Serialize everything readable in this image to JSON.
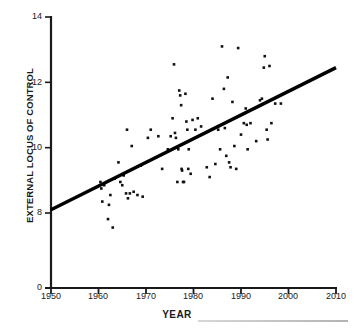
{
  "chart_data": {
    "type": "scatter",
    "title": "",
    "xlabel": "YEAR",
    "ylabel": "EXTERNAL LOCUS OF CONTROL",
    "xlim": [
      1950,
      2010
    ],
    "ylim": [
      0,
      14
    ],
    "y_axis_break": true,
    "y_break_note": "axis jumps from 0 to 8",
    "grid": false,
    "legend": null,
    "xticks": [
      1950,
      1960,
      1970,
      1980,
      1990,
      2000,
      2010
    ],
    "xtick_labels": [
      "1950",
      "1960",
      "1970",
      "1980",
      "1990",
      "2000",
      "2010"
    ],
    "yticks": [
      0,
      8,
      10,
      12,
      14
    ],
    "ytick_labels": [
      "0",
      "8",
      "10",
      "12",
      "14"
    ],
    "marker": "square",
    "marker_color": "#111111",
    "marker_size": 2.6,
    "trendline": {
      "color": "#000000",
      "width": 3.4,
      "x_start": 1950,
      "y_start": 8.1,
      "x_end": 2010,
      "y_end": 12.45
    },
    "points": [
      [
        1960.4,
        8.95
      ],
      [
        1960.6,
        8.75
      ],
      [
        1960.8,
        8.35
      ],
      [
        1961.2,
        8.85
      ],
      [
        1962.0,
        7.35
      ],
      [
        1962.2,
        8.25
      ],
      [
        1962.5,
        8.55
      ],
      [
        1963.0,
        6.45
      ],
      [
        1963.4,
        9.05
      ],
      [
        1964.2,
        9.55
      ],
      [
        1964.6,
        8.95
      ],
      [
        1965.0,
        8.85
      ],
      [
        1965.3,
        9.15
      ],
      [
        1965.8,
        8.6
      ],
      [
        1966.0,
        10.55
      ],
      [
        1966.2,
        8.45
      ],
      [
        1966.6,
        8.6
      ],
      [
        1967.0,
        10.05
      ],
      [
        1967.4,
        8.65
      ],
      [
        1968.2,
        8.55
      ],
      [
        1968.9,
        9.45
      ],
      [
        1969.3,
        8.5
      ],
      [
        1970.4,
        10.3
      ],
      [
        1971.0,
        10.55
      ],
      [
        1972.6,
        10.35
      ],
      [
        1973.4,
        9.35
      ],
      [
        1974.6,
        9.95
      ],
      [
        1975.2,
        10.35
      ],
      [
        1975.6,
        10.9
      ],
      [
        1975.9,
        12.55
      ],
      [
        1976.1,
        10.45
      ],
      [
        1976.3,
        10.3
      ],
      [
        1976.6,
        8.95
      ],
      [
        1976.8,
        9.95
      ],
      [
        1977.0,
        11.75
      ],
      [
        1977.2,
        11.6
      ],
      [
        1977.4,
        11.3
      ],
      [
        1977.5,
        9.35
      ],
      [
        1977.6,
        9.3
      ],
      [
        1977.8,
        8.95
      ],
      [
        1978.0,
        8.95
      ],
      [
        1978.3,
        11.65
      ],
      [
        1978.5,
        10.8
      ],
      [
        1978.7,
        10.55
      ],
      [
        1978.9,
        9.35
      ],
      [
        1979.0,
        9.95
      ],
      [
        1979.4,
        9.2
      ],
      [
        1979.8,
        10.85
      ],
      [
        1980.4,
        10.55
      ],
      [
        1980.9,
        10.9
      ],
      [
        1981.6,
        10.65
      ],
      [
        1982.8,
        9.4
      ],
      [
        1983.4,
        9.1
      ],
      [
        1984.0,
        11.5
      ],
      [
        1984.6,
        9.5
      ],
      [
        1985.2,
        10.55
      ],
      [
        1985.6,
        9.95
      ],
      [
        1986.0,
        13.1
      ],
      [
        1986.4,
        11.8
      ],
      [
        1986.6,
        10.6
      ],
      [
        1986.9,
        9.75
      ],
      [
        1987.2,
        12.15
      ],
      [
        1987.5,
        9.55
      ],
      [
        1987.8,
        9.4
      ],
      [
        1988.2,
        11.4
      ],
      [
        1988.6,
        10.05
      ],
      [
        1989.0,
        9.35
      ],
      [
        1989.4,
        13.05
      ],
      [
        1990.0,
        10.4
      ],
      [
        1990.6,
        10.75
      ],
      [
        1991.0,
        11.2
      ],
      [
        1991.2,
        10.7
      ],
      [
        1991.4,
        9.95
      ],
      [
        1992.0,
        10.75
      ],
      [
        1993.2,
        10.2
      ],
      [
        1994.0,
        11.45
      ],
      [
        1994.4,
        11.5
      ],
      [
        1994.8,
        12.45
      ],
      [
        1995.0,
        12.8
      ],
      [
        1995.4,
        10.55
      ],
      [
        1995.6,
        10.25
      ],
      [
        1996.0,
        12.5
      ],
      [
        1996.4,
        10.75
      ],
      [
        1997.2,
        11.35
      ],
      [
        1998.4,
        11.35
      ]
    ],
    "n_points": 85
  },
  "axes": {
    "axis_color": "#1a1a1a",
    "axis_width": 2
  }
}
